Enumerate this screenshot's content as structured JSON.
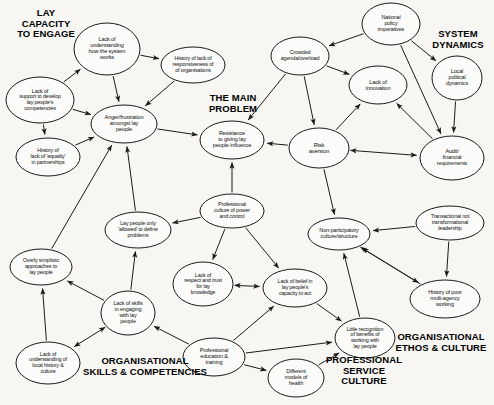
{
  "diagram": {
    "type": "causal-loop-concept-map",
    "stroke_color": "#1a1a1a",
    "background_color": "#f7f6f3",
    "nodes": [
      {
        "id": "lack_understanding_system",
        "label": "Lack of\nunderstanding\nhow the system\nworks",
        "cx": 107,
        "cy": 49,
        "rx": 33,
        "ry": 26,
        "font": 5.6
      },
      {
        "id": "history_lack_responsiveness",
        "label": "History of lack of\nresponsiveness of\nof organisations",
        "cx": 193,
        "cy": 65,
        "rx": 32,
        "ry": 18,
        "font": 5.4
      },
      {
        "id": "lack_support_develop",
        "label": "Lack of\nsupport to develop\nlay people's\ncompetencies",
        "cx": 40,
        "cy": 100,
        "rx": 34,
        "ry": 23,
        "font": 5.4
      },
      {
        "id": "history_lack_equality",
        "label": "History of\nlack of 'equality'\nin partnerships",
        "cx": 48,
        "cy": 157,
        "rx": 32,
        "ry": 19,
        "font": 5.4
      },
      {
        "id": "anger_frustration",
        "label": "Anger/frustration\namongst lay\npeople",
        "cx": 124,
        "cy": 124,
        "rx": 33,
        "ry": 19,
        "font": 5.6
      },
      {
        "id": "resistance_giving_influence",
        "label": "Resistance\nto giving lay\npeople influence",
        "cx": 232,
        "cy": 140,
        "rx": 32,
        "ry": 19,
        "font": 5.6
      },
      {
        "id": "crowded_agenda",
        "label": "Crowded\nagenda/overload",
        "cx": 300,
        "cy": 56,
        "rx": 29,
        "ry": 19,
        "font": 5.5
      },
      {
        "id": "national_policy",
        "label": "National\npolicy\nimperatives",
        "cx": 391,
        "cy": 24,
        "rx": 29,
        "ry": 21,
        "font": 5.5
      },
      {
        "id": "lack_innovation",
        "label": "Lack of\ninnovation",
        "cx": 378,
        "cy": 85,
        "rx": 29,
        "ry": 19,
        "font": 5.8
      },
      {
        "id": "local_political",
        "label": "Local\npolitical\ndynamics",
        "cx": 457,
        "cy": 78,
        "rx": 25,
        "ry": 22,
        "font": 5.5
      },
      {
        "id": "risk_aversion",
        "label": "Risk\naversion",
        "cx": 319,
        "cy": 148,
        "rx": 30,
        "ry": 20,
        "font": 5.8
      },
      {
        "id": "audit_financial",
        "label": "Audit/\nfinancial\nrequirements",
        "cx": 452,
        "cy": 158,
        "rx": 32,
        "ry": 22,
        "font": 5.5
      },
      {
        "id": "professional_culture_power",
        "label": "Professional\nculture of power\nand control",
        "cx": 232,
        "cy": 211,
        "rx": 32,
        "ry": 17,
        "font": 5.4
      },
      {
        "id": "non_participatory",
        "label": "Non-participatory\nculture/structure",
        "cx": 339,
        "cy": 234,
        "rx": 31,
        "ry": 16,
        "font": 5.5
      },
      {
        "id": "transactional_leadership",
        "label": "Transactional not\ntransformational\nleadership",
        "cx": 450,
        "cy": 223,
        "rx": 34,
        "ry": 17,
        "font": 5.4
      },
      {
        "id": "lay_people_allowed",
        "label": "Lay people only\n'allowed' to define\nproblems",
        "cx": 138,
        "cy": 230,
        "rx": 33,
        "ry": 18,
        "font": 5.4
      },
      {
        "id": "overly_simplistic",
        "label": "Overly simplistic\napproaches to\nlay people",
        "cx": 41,
        "cy": 267,
        "rx": 31,
        "ry": 18,
        "font": 5.4
      },
      {
        "id": "lack_skills_engaging",
        "label": "Lack of skills\nin engaging\nwith lay\npeople",
        "cx": 128,
        "cy": 313,
        "rx": 27,
        "ry": 22,
        "font": 5.5
      },
      {
        "id": "lack_respect_trust",
        "label": "Lack of\nrespect and trust\nfor lay\nknowledge",
        "cx": 203,
        "cy": 284,
        "rx": 30,
        "ry": 22,
        "font": 5.4
      },
      {
        "id": "lack_belief_capacity",
        "label": "Lack of belief in\nlay people's\ncapacity to act",
        "cx": 295,
        "cy": 288,
        "rx": 32,
        "ry": 19,
        "font": 5.4
      },
      {
        "id": "history_poor_multiagency",
        "label": "History of poor\nmulti-agency\nworking",
        "cx": 445,
        "cy": 299,
        "rx": 35,
        "ry": 19,
        "font": 5.5
      },
      {
        "id": "little_recognition",
        "label": "Little recognition\nof benefits of\nworking with\nlay people",
        "cx": 365,
        "cy": 338,
        "rx": 30,
        "ry": 20,
        "font": 5.4
      },
      {
        "id": "professional_education",
        "label": "Professional\neducation &\ntraining",
        "cx": 214,
        "cy": 357,
        "rx": 31,
        "ry": 19,
        "font": 5.5
      },
      {
        "id": "lack_understanding_local",
        "label": "Lack of\nunderstanding of\nlocal history &\nculture",
        "cx": 48,
        "cy": 363,
        "rx": 32,
        "ry": 21,
        "font": 5.4
      },
      {
        "id": "different_models_health",
        "label": "Different\nmodels of\nhealth",
        "cx": 296,
        "cy": 378,
        "rx": 28,
        "ry": 19,
        "font": 5.5
      }
    ],
    "cluster_labels": [
      {
        "id": "lay_capacity",
        "text": "LAY\nCAPACITY\nTO ENGAGE",
        "x": 8,
        "y": 8,
        "w": 76,
        "font": 9.5
      },
      {
        "id": "main_problem",
        "text": "THE MAIN\nPROBLEM",
        "x": 192,
        "y": 93,
        "w": 82,
        "font": 9.5
      },
      {
        "id": "system_dynamics",
        "text": "SYSTEM\nDYNAMICS",
        "x": 422,
        "y": 29,
        "w": 72,
        "font": 9.5
      },
      {
        "id": "organisational_skills",
        "text": "ORGANISATIONAL\nSKILLS & COMPETENCIES",
        "x": 70,
        "y": 356,
        "w": 150,
        "font": 9.5
      },
      {
        "id": "professional_service",
        "text": "PROFESSIONAL\nSERVICE\nCULTURE",
        "x": 318,
        "y": 355,
        "w": 92,
        "font": 9.5
      },
      {
        "id": "organisational_ethos",
        "text": "ORGANISATIONAL\nETHOS & CULTURE",
        "x": 388,
        "y": 332,
        "w": 106,
        "font": 9.5
      }
    ],
    "edges": [
      {
        "from": "lack_support_develop",
        "to": "lack_understanding_system",
        "kind": "arrow"
      },
      {
        "from": "lack_understanding_system",
        "to": "history_lack_responsiveness",
        "kind": "arrow"
      },
      {
        "from": "lack_understanding_system",
        "to": "anger_frustration",
        "kind": "arrow"
      },
      {
        "from": "history_lack_responsiveness",
        "to": "anger_frustration",
        "kind": "arrow"
      },
      {
        "from": "lack_support_develop",
        "to": "anger_frustration",
        "kind": "arrow"
      },
      {
        "from": "lack_support_develop",
        "to": "history_lack_equality",
        "kind": "arrow"
      },
      {
        "from": "history_lack_equality",
        "to": "anger_frustration",
        "kind": "arrow"
      },
      {
        "from": "anger_frustration",
        "to": "resistance_giving_influence",
        "kind": "arrow"
      },
      {
        "from": "lay_people_allowed",
        "to": "anger_frustration",
        "kind": "arrow"
      },
      {
        "from": "overly_simplistic",
        "to": "anger_frustration",
        "kind": "arrow"
      },
      {
        "from": "professional_culture_power",
        "to": "resistance_giving_influence",
        "kind": "arrow"
      },
      {
        "from": "risk_aversion",
        "to": "resistance_giving_influence",
        "kind": "arrow"
      },
      {
        "from": "crowded_agenda",
        "to": "resistance_giving_influence",
        "kind": "arrow"
      },
      {
        "from": "national_policy",
        "to": "crowded_agenda",
        "kind": "arrow"
      },
      {
        "from": "national_policy",
        "to": "local_political",
        "kind": "arrow"
      },
      {
        "from": "national_policy",
        "to": "audit_financial",
        "kind": "arrow"
      },
      {
        "from": "crowded_agenda",
        "to": "lack_innovation",
        "kind": "arrow"
      },
      {
        "from": "crowded_agenda",
        "to": "risk_aversion",
        "kind": "arrow"
      },
      {
        "from": "local_political",
        "to": "audit_financial",
        "kind": "arrow"
      },
      {
        "from": "risk_aversion",
        "to": "lack_innovation",
        "kind": "arrow"
      },
      {
        "from": "audit_financial",
        "to": "lack_innovation",
        "kind": "arrow"
      },
      {
        "from": "risk_aversion",
        "to": "audit_financial",
        "kind": "double-arrow"
      },
      {
        "from": "risk_aversion",
        "to": "non_participatory",
        "kind": "arrow"
      },
      {
        "from": "transactional_leadership",
        "to": "non_participatory",
        "kind": "arrow"
      },
      {
        "from": "professional_culture_power",
        "to": "lay_people_allowed",
        "kind": "arrow"
      },
      {
        "from": "professional_culture_power",
        "to": "lack_respect_trust",
        "kind": "arrow"
      },
      {
        "from": "professional_culture_power",
        "to": "lack_belief_capacity",
        "kind": "arrow"
      },
      {
        "from": "lack_respect_trust",
        "to": "lack_belief_capacity",
        "kind": "double-arrow"
      },
      {
        "from": "lack_skills_engaging",
        "to": "lay_people_allowed",
        "kind": "arrow"
      },
      {
        "from": "lack_skills_engaging",
        "to": "overly_simplistic",
        "kind": "arrow"
      },
      {
        "from": "lack_understanding_local",
        "to": "overly_simplistic",
        "kind": "arrow"
      },
      {
        "from": "lack_skills_engaging",
        "to": "lack_understanding_local",
        "kind": "double-arrow"
      },
      {
        "from": "professional_education",
        "to": "lack_skills_engaging",
        "kind": "arrow"
      },
      {
        "from": "professional_education",
        "to": "lack_belief_capacity",
        "kind": "arrow"
      },
      {
        "from": "professional_education",
        "to": "little_recognition",
        "kind": "arrow"
      },
      {
        "from": "professional_education",
        "to": "different_models_health",
        "kind": "arrow"
      },
      {
        "from": "different_models_health",
        "to": "little_recognition",
        "kind": "arrow"
      },
      {
        "from": "lack_belief_capacity",
        "to": "little_recognition",
        "kind": "arrow"
      },
      {
        "from": "little_recognition",
        "to": "non_participatory",
        "kind": "arrow"
      },
      {
        "from": "non_participatory",
        "to": "history_poor_multiagency",
        "kind": "double-arrow"
      },
      {
        "from": "history_poor_multiagency",
        "to": "non_participatory",
        "kind": "arrow"
      },
      {
        "from": "transactional_leadership",
        "to": "history_poor_multiagency",
        "kind": "arrow"
      }
    ]
  }
}
